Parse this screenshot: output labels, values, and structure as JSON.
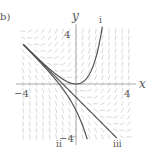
{
  "figure": {
    "panel_label": "b)",
    "x_axis_label": "x",
    "y_axis_label": "y",
    "tick_labels": {
      "x_neg": "−4",
      "x_pos": "4",
      "y_pos": "4",
      "y_neg": "−4"
    },
    "curve_labels": [
      "i",
      "ii",
      "iii"
    ],
    "slope_field": "dy/dx = x + y",
    "domain": {
      "xmin": -4,
      "xmax": 4,
      "ymin": -4,
      "ymax": 4
    },
    "colors": {
      "curve": "#555555",
      "field": "#c8c8c8",
      "axis": "#999999"
    }
  }
}
